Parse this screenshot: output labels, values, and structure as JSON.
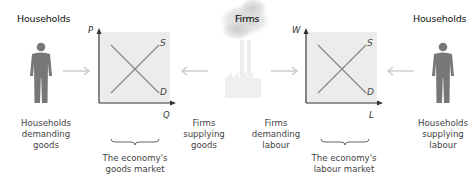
{
  "titles": {
    "left_households": "Households",
    "firms": "Firms",
    "right_households": "Households"
  },
  "goods_market": {
    "y_axis": "P",
    "x_axis": "Q",
    "supply": "S",
    "demand": "D",
    "caption_line1": "The economy's",
    "caption_line2": "goods market"
  },
  "labour_market": {
    "y_axis": "W",
    "x_axis": "L",
    "supply": "S",
    "demand": "D",
    "caption_line1": "The economy's",
    "caption_line2": "labour market"
  },
  "labels": {
    "households_demanding_goods": [
      "Households",
      "demanding",
      "goods"
    ],
    "firms_supplying_goods": [
      "Firms",
      "supplying",
      "goods"
    ],
    "firms_demanding_labour": [
      "Firms",
      "demanding",
      "labour"
    ],
    "households_supplying_labour": [
      "Households",
      "supplying",
      "labour"
    ]
  },
  "colors": {
    "chart_fill": "#ececec",
    "figure": "#777777",
    "arrow": "#c8c8c8",
    "curve": "#888888",
    "axis": "#333333"
  }
}
